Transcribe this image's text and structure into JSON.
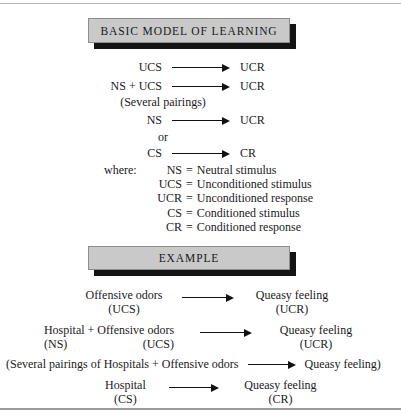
{
  "banners": {
    "basic": "BASIC MODEL OF LEARNING",
    "example": "EXAMPLE"
  },
  "model": {
    "rows": [
      {
        "left": "UCS",
        "right": "UCR"
      },
      {
        "left": "NS + UCS",
        "right": "UCR"
      },
      {
        "left": "NS",
        "right": "UCR"
      },
      {
        "left": "CS",
        "right": "CR"
      }
    ],
    "several_pairings": "(Several pairings)",
    "or": "or"
  },
  "legend": {
    "where_label": "where:",
    "equals": "=",
    "entries": [
      {
        "abbr": "NS",
        "definition": "Neutral stimulus"
      },
      {
        "abbr": "UCS",
        "definition": "Unconditioned stimulus"
      },
      {
        "abbr": "UCR",
        "definition": "Unconditioned response"
      },
      {
        "abbr": "CS",
        "definition": "Conditioned stimulus"
      },
      {
        "abbr": "CR",
        "definition": "Conditioned response"
      }
    ]
  },
  "example": {
    "row1": {
      "left_term": "Offensive odors",
      "left_code": "(UCS)",
      "right_term": "Queasy feeling",
      "right_code": "(UCR)"
    },
    "row2": {
      "left_term_a": "Hospital",
      "left_plus": "+",
      "left_term_b": "Offensive odors",
      "left_code_a": "(NS)",
      "left_code_b": "(UCS)",
      "right_term": "Queasy feeling",
      "right_code": "(UCR)"
    },
    "row3": {
      "prefix": "(Several pairings of Hospitals + Offensive odors",
      "suffix": "Queasy feeling)"
    },
    "row4": {
      "left_term": "Hospital",
      "left_code": "(CS)",
      "right_term": "Queasy feeling",
      "right_code": "(CR)"
    }
  },
  "colors": {
    "banner_fill": "#c9c9c9",
    "banner_shadow": "#141414",
    "rule": "#b6b6b6",
    "text": "#1a1a1a"
  }
}
